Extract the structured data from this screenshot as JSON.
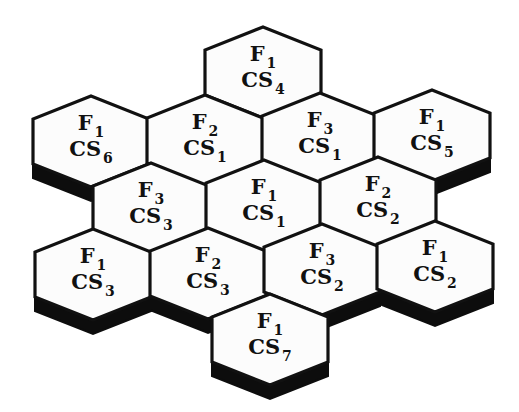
{
  "diagram": {
    "colors": {
      "outline": "#111111",
      "cell_fill": "#fcfcfc",
      "shadow": "#0d0d0d",
      "background": "#ffffff"
    },
    "hex": {
      "rx": 58,
      "ry_top": 23,
      "side": 45
    },
    "cells": [
      {
        "id": "c1",
        "cx": 263,
        "top": 27,
        "shadow": false,
        "f_prefix": "F",
        "f_sub": "1",
        "cs_prefix": "CS",
        "cs_sub": "4"
      },
      {
        "id": "c2",
        "cx": 91,
        "top": 96,
        "shadow": true,
        "f_prefix": "F",
        "f_sub": "1",
        "cs_prefix": "CS",
        "cs_sub": "6"
      },
      {
        "id": "c3",
        "cx": 205,
        "top": 95,
        "shadow": false,
        "f_prefix": "F",
        "f_sub": "2",
        "cs_prefix": "CS",
        "cs_sub": "1"
      },
      {
        "id": "c4",
        "cx": 320,
        "top": 93,
        "shadow": false,
        "f_prefix": "F",
        "f_sub": "3",
        "cs_prefix": "CS",
        "cs_sub": "1"
      },
      {
        "id": "c5",
        "cx": 432,
        "top": 90,
        "shadow": true,
        "f_prefix": "F",
        "f_sub": "1",
        "cs_prefix": "CS",
        "cs_sub": "5"
      },
      {
        "id": "c6",
        "cx": 151,
        "top": 163,
        "shadow": false,
        "f_prefix": "F",
        "f_sub": "3",
        "cs_prefix": "CS",
        "cs_sub": "3"
      },
      {
        "id": "c7",
        "cx": 264,
        "top": 160,
        "shadow": false,
        "f_prefix": "F",
        "f_sub": "1",
        "cs_prefix": "CS",
        "cs_sub": "1"
      },
      {
        "id": "c8",
        "cx": 378,
        "top": 157,
        "shadow": false,
        "f_prefix": "F",
        "f_sub": "2",
        "cs_prefix": "CS",
        "cs_sub": "2"
      },
      {
        "id": "c9",
        "cx": 93,
        "top": 229,
        "shadow": true,
        "f_prefix": "F",
        "f_sub": "1",
        "cs_prefix": "CS",
        "cs_sub": "3"
      },
      {
        "id": "c10",
        "cx": 208,
        "top": 228,
        "shadow": true,
        "f_prefix": "F",
        "f_sub": "2",
        "cs_prefix": "CS",
        "cs_sub": "3"
      },
      {
        "id": "c11",
        "cx": 322,
        "top": 224,
        "shadow": true,
        "f_prefix": "F",
        "f_sub": "3",
        "cs_prefix": "CS",
        "cs_sub": "2"
      },
      {
        "id": "c12",
        "cx": 435,
        "top": 221,
        "shadow": true,
        "f_prefix": "F",
        "f_sub": "1",
        "cs_prefix": "CS",
        "cs_sub": "2"
      },
      {
        "id": "c13",
        "cx": 270,
        "top": 294,
        "shadow": true,
        "f_prefix": "F",
        "f_sub": "1",
        "cs_prefix": "CS",
        "cs_sub": "7"
      }
    ]
  }
}
